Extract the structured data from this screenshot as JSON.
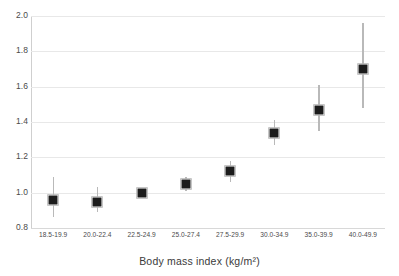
{
  "chart_data": {
    "type": "scatter",
    "title": "",
    "xlabel": "Body mass index (kg/m²)",
    "ylabel": "",
    "categories": [
      "18.5-19.9",
      "20.0-22.4",
      "22.5-24.9",
      "25.0-27.4",
      "27.5-29.9",
      "30.0-34.9",
      "35.0-39.9",
      "40.0-49.9"
    ],
    "values": [
      0.96,
      0.95,
      1.0,
      1.05,
      1.12,
      1.34,
      1.47,
      1.7
    ],
    "error_low": [
      0.86,
      0.89,
      1.0,
      1.01,
      1.06,
      1.27,
      1.35,
      1.48
    ],
    "error_high": [
      1.09,
      1.03,
      1.0,
      1.09,
      1.18,
      1.41,
      1.61,
      1.96
    ],
    "ylim": [
      0.8,
      2.0
    ],
    "yticks": [
      "0.8",
      "1.0",
      "1.2",
      "1.4",
      "1.6",
      "1.8",
      "2.0"
    ],
    "ytick_values": [
      0.8,
      1.0,
      1.2,
      1.4,
      1.6,
      1.8,
      2.0
    ],
    "grid": true,
    "legend": "none",
    "series_name": "Hazard ratio",
    "marker_color": "#1c1c1c",
    "errorbar_color": "#b9b9b9",
    "gridline_color": "#e8e8e8"
  }
}
